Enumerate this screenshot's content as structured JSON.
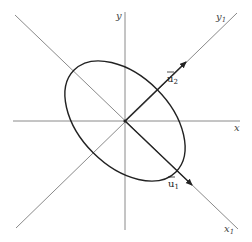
{
  "diagram": {
    "type": "rotated-axes-ellipse",
    "center": [
      125,
      121
    ],
    "axes": {
      "x": {
        "label": "x"
      },
      "y": {
        "label": "y"
      },
      "x1": {
        "label": "x",
        "subscript": "1"
      },
      "y1": {
        "label": "y",
        "subscript": "1"
      }
    },
    "vectors": {
      "u1": {
        "label": "u",
        "subscript": "1",
        "bar": true,
        "direction": "along x1"
      },
      "u2": {
        "label": "u",
        "subscript": "2",
        "bar": true,
        "direction": "along y1"
      }
    },
    "ellipse": {
      "semi_major": 73,
      "semi_minor": 45,
      "rotation_deg": 45,
      "major_along": "x1"
    },
    "colors": {
      "axes": "#7a7a7a",
      "ellipse": "#222222",
      "vectors": "#222222",
      "background": "#ffffff"
    }
  }
}
